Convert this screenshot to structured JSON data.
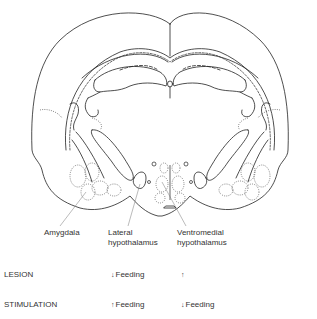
{
  "diagram": {
    "structures": [
      {
        "id": "amygdala",
        "label": "Amygdala"
      },
      {
        "id": "lateral-hypothalamus",
        "label_line1": "Lateral",
        "label_line2": "hypothalamus"
      },
      {
        "id": "ventromedial-hypothalamus",
        "label_line1": "Ventromedial",
        "label_line2": "hypothalamus"
      }
    ]
  },
  "table": {
    "rows": [
      {
        "label": "LESION",
        "lateral": {
          "arrow": "↓",
          "text": "Feeding"
        },
        "ventromedial": {
          "arrow": "↑",
          "text": ""
        }
      },
      {
        "label": "STIMULATION",
        "lateral": {
          "arrow": "↑",
          "text": "Feeding"
        },
        "ventromedial": {
          "arrow": "↓",
          "text": "Feeding"
        }
      }
    ]
  },
  "colors": {
    "line": "#222222",
    "dotted": "#555555",
    "text": "#333333",
    "background": "#ffffff"
  }
}
